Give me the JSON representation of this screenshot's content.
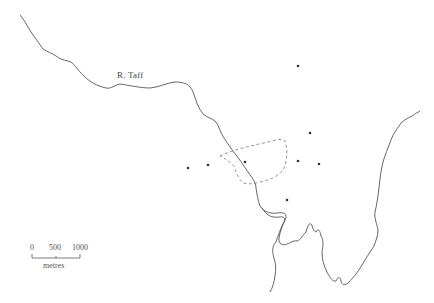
{
  "map": {
    "river_label": "R. Taff",
    "scale_bar": {
      "ticks": [
        "0",
        "500",
        "1000"
      ],
      "unit": "metres"
    },
    "colors": {
      "line": "#555555",
      "dashed": "#777777",
      "dot": "#333333",
      "background": "#ffffff"
    },
    "sites": [
      {
        "x": 298,
        "y": 66
      },
      {
        "x": 310,
        "y": 133
      },
      {
        "x": 188,
        "y": 168
      },
      {
        "x": 208,
        "y": 165
      },
      {
        "x": 245,
        "y": 162
      },
      {
        "x": 298,
        "y": 161
      },
      {
        "x": 319,
        "y": 164
      },
      {
        "x": 287,
        "y": 200
      }
    ]
  }
}
